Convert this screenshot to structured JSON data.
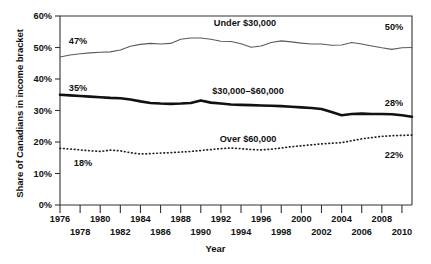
{
  "chart_data": {
    "type": "line",
    "title": "",
    "xlabel": "Year",
    "ylabel": "Share of Canadians in income bracket",
    "xlim": [
      1976,
      2011
    ],
    "ylim": [
      0,
      60
    ],
    "yticks": [
      "0%",
      "10%",
      "20%",
      "30%",
      "40%",
      "50%",
      "60%"
    ],
    "ytick_values": [
      0,
      10,
      20,
      30,
      40,
      50,
      60
    ],
    "grid": false,
    "legend": "inline-annotations",
    "x": [
      1976,
      1977,
      1978,
      1979,
      1980,
      1981,
      1982,
      1983,
      1984,
      1985,
      1986,
      1987,
      1988,
      1989,
      1990,
      1991,
      1992,
      1993,
      1994,
      1995,
      1996,
      1997,
      1998,
      1999,
      2000,
      2001,
      2002,
      2003,
      2004,
      2005,
      2006,
      2007,
      2008,
      2009,
      2010,
      2011
    ],
    "xticks_top": [
      "1976",
      "1980",
      "1984",
      "1988",
      "1992",
      "1996",
      "2000",
      "2004",
      "2008"
    ],
    "xticks_top_values": [
      1976,
      1980,
      1984,
      1988,
      1992,
      1996,
      2000,
      2004,
      2008
    ],
    "xticks_bottom": [
      "1978",
      "1982",
      "1986",
      "1990",
      "1994",
      "1998",
      "2002",
      "2006",
      "2010"
    ],
    "xticks_bottom_values": [
      1978,
      1982,
      1986,
      1990,
      1994,
      1998,
      2002,
      2006,
      2010
    ],
    "series": [
      {
        "name": "Under $30,000",
        "style": "thin-solid",
        "color": "#5a5a5a",
        "start_label": "47%",
        "end_label": "50%",
        "values": [
          47.0,
          47.6,
          48.0,
          48.3,
          48.5,
          48.6,
          49.2,
          50.4,
          51.0,
          51.3,
          51.1,
          51.3,
          52.6,
          53.0,
          53.0,
          52.6,
          52.0,
          51.9,
          51.2,
          50.1,
          50.5,
          51.6,
          52.1,
          51.8,
          51.4,
          51.1,
          51.1,
          50.7,
          50.8,
          51.6,
          51.1,
          50.5,
          49.9,
          49.4,
          49.9,
          50.0
        ]
      },
      {
        "name": "$30,000-$60,000",
        "style": "thick-solid",
        "color": "#111111",
        "start_label": "35%",
        "end_label": "28%",
        "values": [
          35.0,
          34.8,
          34.6,
          34.4,
          34.2,
          34.0,
          33.9,
          33.5,
          32.9,
          32.4,
          32.2,
          32.1,
          32.2,
          32.4,
          33.2,
          32.5,
          32.2,
          31.9,
          31.8,
          31.7,
          31.6,
          31.5,
          31.4,
          31.2,
          31.0,
          30.8,
          30.5,
          29.5,
          28.5,
          28.9,
          29.0,
          28.9,
          28.9,
          28.8,
          28.5,
          28.0
        ]
      },
      {
        "name": "Over $60,000",
        "style": "dotted",
        "color": "#222222",
        "start_label": "18%",
        "end_label": "22%",
        "values": [
          18.0,
          17.8,
          17.5,
          17.2,
          17.0,
          17.4,
          17.2,
          16.6,
          16.2,
          16.3,
          16.5,
          16.6,
          16.8,
          17.0,
          17.3,
          17.6,
          17.9,
          18.1,
          17.9,
          17.6,
          17.5,
          17.7,
          18.1,
          18.5,
          18.8,
          19.1,
          19.4,
          19.6,
          19.8,
          20.4,
          21.0,
          21.4,
          21.8,
          22.0,
          22.1,
          22.2
        ]
      }
    ],
    "annotations": [
      {
        "text": "Under $30,000",
        "series": "Under $30,000",
        "position": "above-middle"
      },
      {
        "text": "$30,000–$60,000",
        "series": "$30,000-$60,000",
        "position": "above-middle"
      },
      {
        "text": "Over $60,000",
        "series": "Over $60,000",
        "position": "above-right"
      }
    ]
  }
}
